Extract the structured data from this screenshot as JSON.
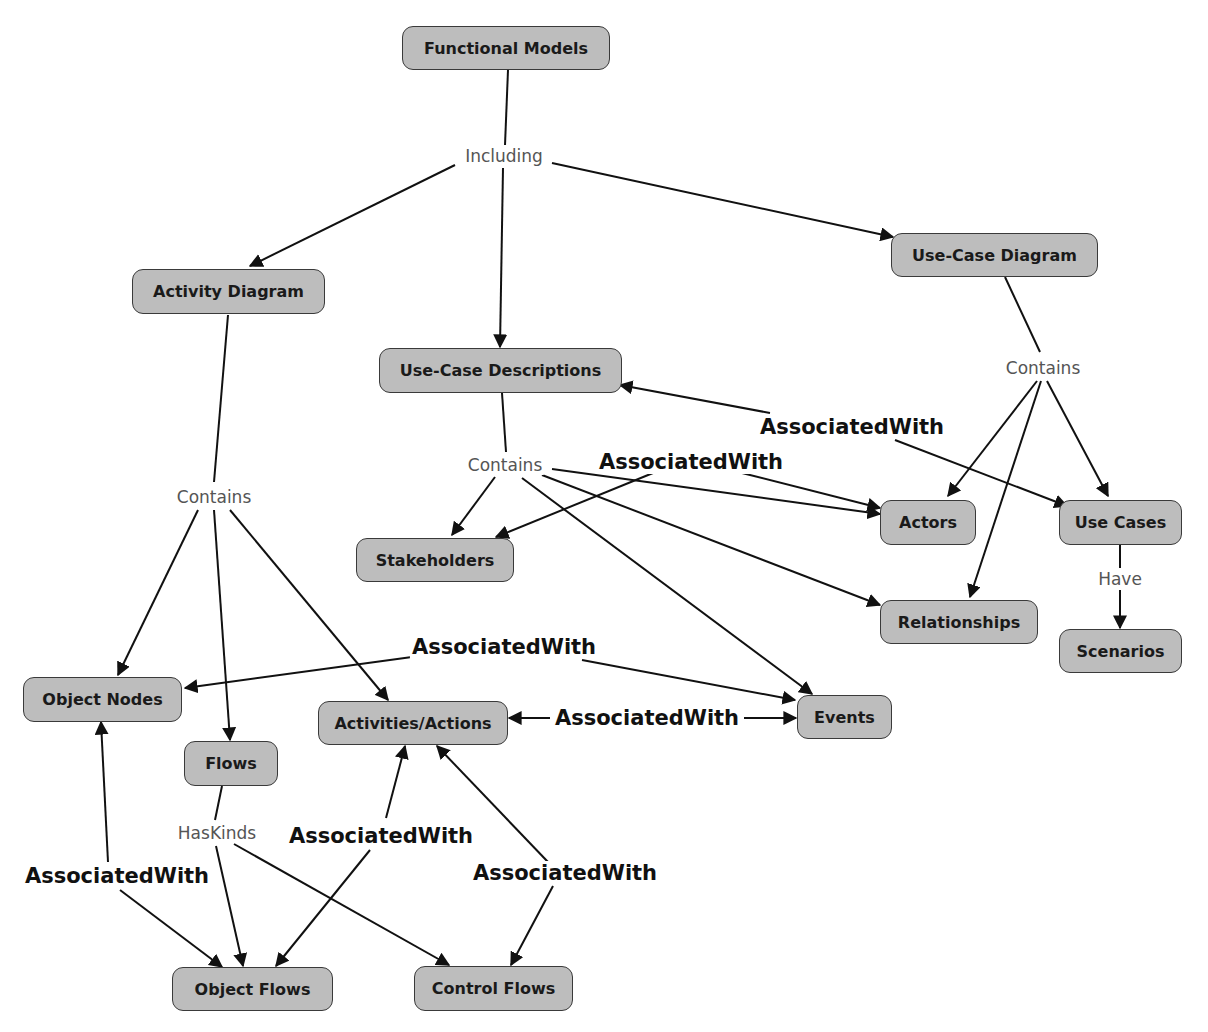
{
  "diagram": {
    "title": "Functional Models",
    "colors": {
      "node_fill": "#bdbdbd",
      "node_border": "#3a3a3a",
      "edge": "#111111",
      "weak_label": "#555555"
    },
    "nodes": {
      "functional_models": "Functional Models",
      "activity_diagram": "Activity Diagram",
      "use_case_descriptions": "Use-Case Descriptions",
      "use_case_diagram": "Use-Case Diagram",
      "stakeholders": "Stakeholders",
      "actors": "Actors",
      "use_cases": "Use Cases",
      "relationships": "Relationships",
      "scenarios": "Scenarios",
      "object_nodes": "Object Nodes",
      "activities_actions": "Activities/Actions",
      "events": "Events",
      "flows": "Flows",
      "object_flows": "Object Flows",
      "control_flows": "Control Flows"
    },
    "labels": {
      "including": "Including",
      "contains_activity": "Contains",
      "contains_ucd_desc": "Contains",
      "contains_ucd": "Contains",
      "have": "Have",
      "has_kinds": "HasKinds",
      "assoc_desc_usecases": "AssociatedWith",
      "assoc_stakeholders_actors": "AssociatedWith",
      "assoc_objnodes_events": "AssociatedWith",
      "assoc_activities_events": "AssociatedWith",
      "assoc_objnodes_objflows": "AssociatedWith",
      "assoc_activities_objflows": "AssociatedWith",
      "assoc_activities_controlflows": "AssociatedWith"
    },
    "edges": [
      {
        "from": "Functional Models",
        "label": "Including",
        "to": [
          "Activity Diagram",
          "Use-Case Descriptions",
          "Use-Case Diagram"
        ]
      },
      {
        "from": "Activity Diagram",
        "label": "Contains",
        "to": [
          "Object Nodes",
          "Flows",
          "Activities/Actions"
        ]
      },
      {
        "from": "Use-Case Descriptions",
        "label": "Contains",
        "to": [
          "Stakeholders",
          "Actors",
          "Relationships",
          "Events"
        ]
      },
      {
        "from": "Use-Case Diagram",
        "label": "Contains",
        "to": [
          "Actors",
          "Relationships",
          "Use Cases"
        ]
      },
      {
        "from": "Use Cases",
        "label": "Have",
        "to": [
          "Scenarios"
        ]
      },
      {
        "from": "Flows",
        "label": "HasKinds",
        "to": [
          "Object Flows",
          "Control Flows"
        ]
      },
      {
        "label": "AssociatedWith",
        "between": [
          "Use-Case Descriptions",
          "Use Cases"
        ]
      },
      {
        "label": "AssociatedWith",
        "between": [
          "Stakeholders",
          "Actors"
        ]
      },
      {
        "label": "AssociatedWith",
        "between": [
          "Object Nodes",
          "Events"
        ]
      },
      {
        "label": "AssociatedWith",
        "between": [
          "Activities/Actions",
          "Events"
        ]
      },
      {
        "label": "AssociatedWith",
        "between": [
          "Object Nodes",
          "Object Flows"
        ]
      },
      {
        "label": "AssociatedWith",
        "between": [
          "Activities/Actions",
          "Object Flows"
        ]
      },
      {
        "label": "AssociatedWith",
        "between": [
          "Activities/Actions",
          "Control Flows"
        ]
      }
    ]
  }
}
